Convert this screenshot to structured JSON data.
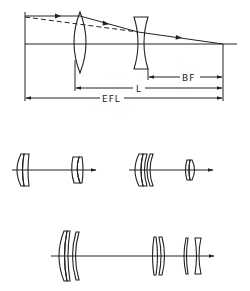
{
  "figure": {
    "type": "telephoto lens schematic",
    "top_diagram": {
      "elements": [
        "positive-lens",
        "negative-lens",
        "optical-axis",
        "marginal-ray",
        "extended-ray-dashed",
        "focal-point"
      ],
      "dimensions": [
        {
          "label": "BF"
        },
        {
          "label": "L"
        },
        {
          "label": "EFL"
        }
      ]
    },
    "lens_layouts": [
      {
        "id": "layout-1",
        "front_group": "cemented doublet",
        "rear_group": "negative doublet"
      },
      {
        "id": "layout-2",
        "front_group": "three-element meniscus group",
        "rear_group": "compact doublet"
      },
      {
        "id": "layout-3",
        "front_group": "three-element group",
        "middle_group": "doublet",
        "rear_group": "negative doublet"
      }
    ]
  },
  "labels": {
    "bf": "BF",
    "l": "L",
    "efl": "EFL"
  }
}
